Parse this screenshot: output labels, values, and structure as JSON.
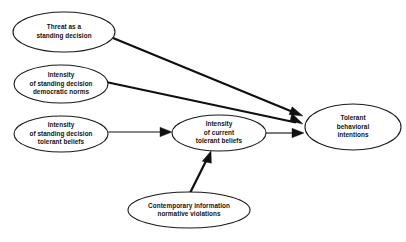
{
  "diagram": {
    "type": "path-diagram",
    "background_color": "#ffffff",
    "stroke_color": "#101010",
    "text_color": "#121212",
    "nodes": [
      {
        "id": "threat",
        "lines": [
          "Threat as a",
          "standing decision"
        ],
        "cx": 64,
        "cy": 32,
        "rx": 51,
        "ry": 20
      },
      {
        "id": "democratic-norms",
        "lines": [
          "Intensity",
          "of standing decision",
          "democratic norms"
        ],
        "cx": 61,
        "cy": 84,
        "rx": 47,
        "ry": 19
      },
      {
        "id": "tolerant-beliefs-standing",
        "lines": [
          "Intensity",
          "of standing decision",
          "tolerant beliefs"
        ],
        "cx": 61,
        "cy": 134,
        "rx": 47,
        "ry": 18
      },
      {
        "id": "current-tolerant-beliefs",
        "lines": [
          "Intensity",
          "of current",
          "tolerant beliefs"
        ],
        "cx": 219,
        "cy": 133,
        "rx": 47,
        "ry": 18
      },
      {
        "id": "tolerant-behavioral-intentions",
        "lines": [
          "Tolerant",
          "behavioral",
          "intentions"
        ],
        "cx": 353,
        "cy": 127,
        "rx": 48,
        "ry": 23
      },
      {
        "id": "contemporary-information",
        "lines": [
          "Contemporary information",
          "normative violations"
        ],
        "cx": 189,
        "cy": 210,
        "rx": 61,
        "ry": 18
      }
    ],
    "edges": [
      {
        "id": "threat-to-intentions",
        "from": "threat",
        "to": "tolerant-behavioral-intentions",
        "x1": 113,
        "y1": 38,
        "x2": 303,
        "y2": 116,
        "width": 2.2
      },
      {
        "id": "democratic-norms-to-intentions",
        "from": "democratic-norms",
        "to": "tolerant-behavioral-intentions",
        "x1": 106,
        "y1": 82,
        "x2": 303,
        "y2": 124,
        "width": 2.2
      },
      {
        "id": "standing-beliefs-to-current-beliefs",
        "from": "tolerant-beliefs-standing",
        "to": "current-tolerant-beliefs",
        "x1": 108,
        "y1": 132,
        "x2": 171,
        "y2": 132,
        "width": 1.1
      },
      {
        "id": "current-beliefs-to-intentions",
        "from": "current-tolerant-beliefs",
        "to": "tolerant-behavioral-intentions",
        "x1": 266,
        "y1": 133,
        "x2": 304,
        "y2": 133,
        "width": 1.1
      },
      {
        "id": "contemporary-to-current-beliefs",
        "from": "contemporary-information",
        "to": "current-tolerant-beliefs",
        "x1": 190,
        "y1": 193,
        "x2": 211,
        "y2": 151,
        "width": 2.2
      }
    ]
  }
}
